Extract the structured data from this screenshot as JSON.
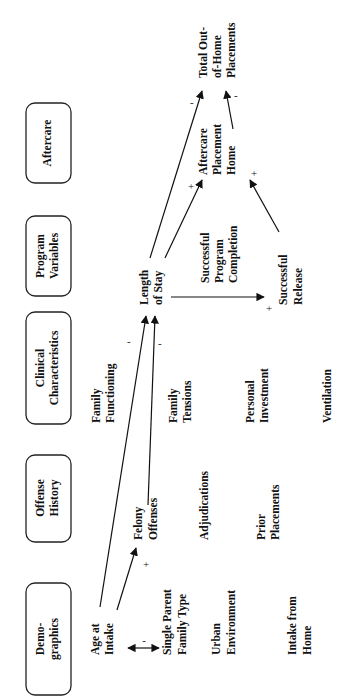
{
  "categories": [
    {
      "id": "demographics",
      "lines": [
        "Demo-",
        "graphics"
      ]
    },
    {
      "id": "offense-history",
      "lines": [
        "Offense",
        "History"
      ]
    },
    {
      "id": "clinical-characteristics",
      "lines": [
        "Clinical",
        "Characteristics"
      ]
    },
    {
      "id": "program-variables",
      "lines": [
        "Program",
        "Variables"
      ]
    },
    {
      "id": "aftercare",
      "lines": [
        "Aftercare"
      ]
    }
  ],
  "variables": {
    "age_at_intake": [
      "Age at",
      "Intake"
    ],
    "single_parent": [
      "Single Parent",
      "Family Type"
    ],
    "urban": [
      "Urban",
      "Environment"
    ],
    "intake_home": [
      "Intake from",
      "Home"
    ],
    "felony": [
      "Felony",
      "Offenses"
    ],
    "adjudications": [
      "Adjudications"
    ],
    "prior_placements": [
      "Prior",
      "Placements"
    ],
    "family_functioning": [
      "Family",
      "Functioning"
    ],
    "family_tensions": [
      "Family",
      "Tensions"
    ],
    "personal_investment": [
      "Personal",
      "Investment"
    ],
    "ventilation": [
      "Ventilation"
    ],
    "length_of_stay": [
      "Length",
      "of Stay"
    ],
    "successful_completion": [
      "Successful",
      "Program",
      "Completion"
    ],
    "successful_release": [
      "Successful",
      "Release"
    ],
    "aftercare_home": [
      "Aftercare",
      "Placement",
      "Home"
    ],
    "total_placements": [
      "Total Out-",
      "of-Home",
      "Placements"
    ]
  },
  "signs": {
    "age_singleparent": "-",
    "age_felony": "+",
    "age_los": "-",
    "felony_los": "-",
    "los_release": "+",
    "los_aftercare": "+",
    "los_total": "-",
    "release_aftercare": "+",
    "aftercare_total": "-"
  }
}
